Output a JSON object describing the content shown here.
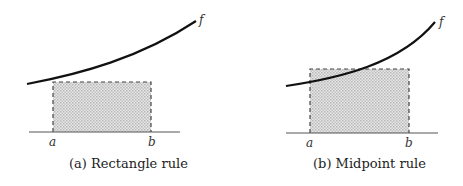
{
  "panels": [
    {
      "caption": "(a) Rectangle rule",
      "func_label": "f",
      "a_label": "a",
      "b_label": "b",
      "rule": "rectangle (left endpoint height)"
    },
    {
      "caption": "(b) Midpoint rule",
      "func_label": "f",
      "a_label": "a",
      "b_label": "b",
      "rule": "midpoint (height at (a+b)/2)"
    }
  ],
  "colors": {
    "curve": "#111111",
    "fill": "#d4d4d4",
    "dash": "#444444",
    "axis": "#555555"
  }
}
